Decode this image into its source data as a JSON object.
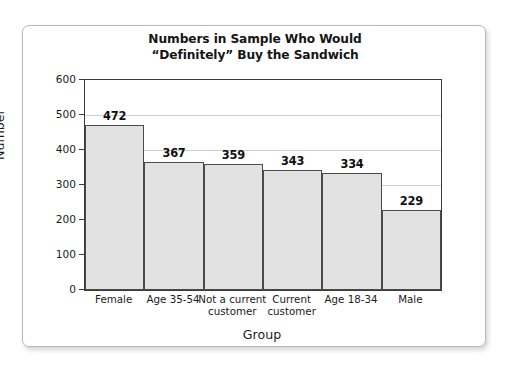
{
  "chart_data": {
    "type": "bar",
    "title": "Numbers in Sample Who Would “Definitely” Buy the Sandwich",
    "title_lines": [
      "Numbers in Sample Who Would",
      "“Definitely” Buy the Sandwich"
    ],
    "categories": [
      "Female",
      "Age 35-54",
      "Not a current customer",
      "Current customer",
      "Age 18-34",
      "Male"
    ],
    "category_label_lines": [
      [
        "Female"
      ],
      [
        "Age 35-54"
      ],
      [
        "Not a current",
        "customer"
      ],
      [
        "Current",
        "customer"
      ],
      [
        "Age 18-34"
      ],
      [
        "Male"
      ]
    ],
    "values": [
      472,
      367,
      359,
      343,
      334,
      229
    ],
    "value_labels": [
      "472",
      "367",
      "359",
      "343",
      "334",
      "229"
    ],
    "xlabel": "Group",
    "ylabel": "Number",
    "ylim": [
      0,
      600
    ],
    "ytick_values": [
      0,
      100,
      200,
      300,
      400,
      500,
      600
    ],
    "ytick_labels": [
      "0",
      "100",
      "200",
      "300",
      "400",
      "500",
      "600"
    ],
    "grid": true,
    "legend": false,
    "bar_fill_color": "#e2e2e2",
    "bar_border_color": "#4a4a4a",
    "gridline_color": "#d2d2d2",
    "axis_color": "#3b3b3b",
    "text_color": "#1b1b1b",
    "background_color": "#ffffff"
  }
}
